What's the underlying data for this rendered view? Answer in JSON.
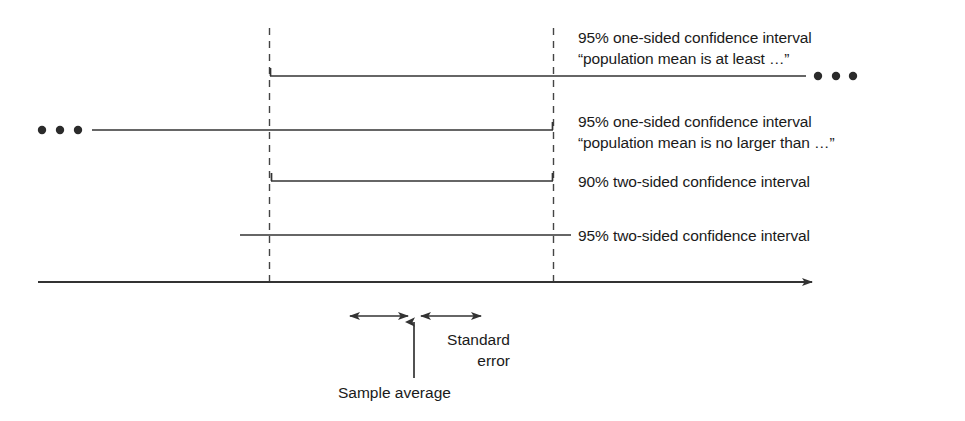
{
  "figure": {
    "colors": {
      "ink": "#333333",
      "text": "#1a1a1a",
      "dash": "#444444"
    }
  },
  "intervals": [
    {
      "id": "ci-95-one-sided-lower",
      "label_line1": "95% one-sided confidence interval",
      "label_line2": "“population mean is at least …”",
      "kind": "one-sided",
      "level": "95%",
      "direction": "extends-right",
      "y": 76,
      "x_start": 270,
      "x_end": 806,
      "left_cap": true,
      "right_cap": false,
      "ellipsis_side": "right"
    },
    {
      "id": "ci-95-one-sided-upper",
      "label_line1": "95% one-sided confidence interval",
      "label_line2": "“population mean is no larger than …”",
      "kind": "one-sided",
      "level": "95%",
      "direction": "extends-left",
      "y": 130,
      "x_start": 92,
      "x_end": 553,
      "left_cap": false,
      "right_cap": true,
      "ellipsis_side": "left"
    },
    {
      "id": "ci-90-two-sided",
      "label_line1": "90% two-sided confidence interval",
      "label_line2": "",
      "kind": "two-sided",
      "level": "90%",
      "direction": "bounded",
      "y": 181,
      "x_start": 271,
      "x_end": 553,
      "left_cap": true,
      "right_cap": true,
      "ellipsis_side": "none"
    },
    {
      "id": "ci-95-two-sided",
      "label_line1": "95% two-sided confidence interval",
      "label_line2": "",
      "kind": "two-sided",
      "level": "95%",
      "direction": "bounded",
      "y": 235,
      "x_start": 240,
      "x_end": 571,
      "left_cap": false,
      "right_cap": false,
      "ellipsis_side": "none"
    }
  ],
  "ellipsis": {
    "left_dots_x": [
      42,
      60,
      78
    ],
    "left_dots_y": 130,
    "right_dots_x": [
      818,
      836,
      853
    ],
    "right_dots_y": 76,
    "radius": 4.2
  },
  "guides": {
    "dashed_left_x": 269,
    "dashed_right_x": 553,
    "dash_top_y": 28,
    "dash_bottom_y": 282
  },
  "axis": {
    "y": 282,
    "x_start": 38,
    "x_end": 822
  },
  "annotations": {
    "standard_error": {
      "line1": "Standard",
      "line2": "error"
    },
    "sample_average": "Sample average",
    "se_arrow_left": {
      "x1": 345,
      "x2": 412,
      "y": 316
    },
    "se_arrow_right": {
      "x1": 416,
      "x2": 487,
      "y": 316
    },
    "sample_average_arrow": {
      "x": 414,
      "y_bottom": 378,
      "y_top": 318
    }
  }
}
